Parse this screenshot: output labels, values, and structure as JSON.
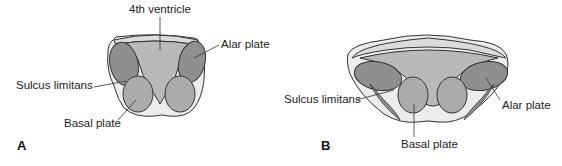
{
  "figure": {
    "panels": [
      {
        "letter": "A",
        "labels": {
          "ventricle": "4th ventricle",
          "alar": "Alar plate",
          "sulcus": "Sulcus limitans",
          "basal": "Basal plate"
        }
      },
      {
        "letter": "B",
        "labels": {
          "sulcus": "Sulcus limitans",
          "alar": "Alar plate",
          "basal": "Basal plate"
        }
      }
    ],
    "colors": {
      "outline": "#333333",
      "outer_tissue": "#ececec",
      "ventricle": "#b9b9b9",
      "alar": "#8f8f8f",
      "basal": "#ababab",
      "text": "#222222"
    }
  }
}
